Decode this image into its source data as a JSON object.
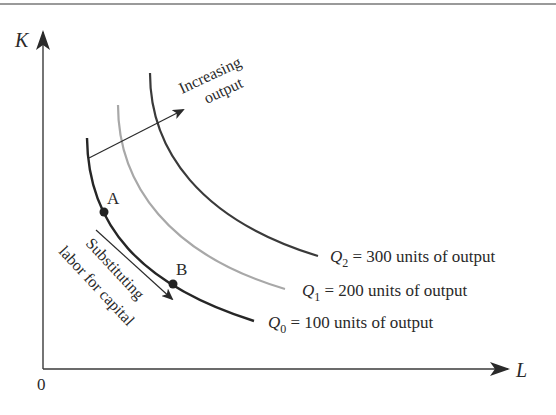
{
  "figure": {
    "type": "isoquant-diagram",
    "axes": {
      "y_label": "K",
      "x_label": "L",
      "origin_label": "0"
    },
    "isoquants": [
      {
        "id": "Q0",
        "symbol": "Q",
        "subscript": "0",
        "label_rest": " = 100 units of output",
        "output": 100,
        "color": "#262626"
      },
      {
        "id": "Q1",
        "symbol": "Q",
        "subscript": "1",
        "label_rest": " = 200 units of output",
        "output": 200,
        "color": "#a8a8a8"
      },
      {
        "id": "Q2",
        "symbol": "Q",
        "subscript": "2",
        "label_rest": " = 300 units of output",
        "output": 300,
        "color": "#3a3a3a"
      }
    ],
    "points": [
      {
        "label": "A",
        "on": "Q0"
      },
      {
        "label": "B",
        "on": "Q0"
      }
    ],
    "annotations": {
      "increasing_output_line1": "Increasing",
      "increasing_output_line2": "output",
      "substitution_line1": "Substituting",
      "substitution_line2": "labor for capital"
    },
    "colors": {
      "axis": "#3a3a3a",
      "top_rule": "#9a9a9a",
      "text": "#2a2a2a"
    }
  }
}
